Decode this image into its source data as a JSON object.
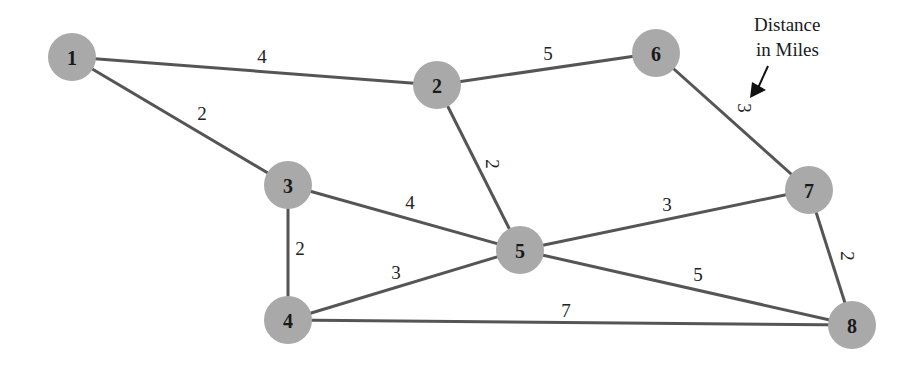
{
  "diagram": {
    "type": "weighted-undirected-graph",
    "annotation": {
      "line1": "Distance",
      "line2": "in Miles"
    },
    "nodes": [
      {
        "id": "1",
        "label": "1",
        "x": 72,
        "y": 57
      },
      {
        "id": "2",
        "label": "2",
        "x": 437,
        "y": 85
      },
      {
        "id": "3",
        "label": "3",
        "x": 288,
        "y": 185
      },
      {
        "id": "4",
        "label": "4",
        "x": 288,
        "y": 320
      },
      {
        "id": "5",
        "label": "5",
        "x": 520,
        "y": 250
      },
      {
        "id": "6",
        "label": "6",
        "x": 656,
        "y": 53
      },
      {
        "id": "7",
        "label": "7",
        "x": 809,
        "y": 190
      },
      {
        "id": "8",
        "label": "8",
        "x": 852,
        "y": 325
      }
    ],
    "edges": [
      {
        "from": "1",
        "to": "2",
        "weight": "4",
        "lx": 262,
        "ly": 56,
        "rot": 0
      },
      {
        "from": "1",
        "to": "3",
        "weight": "2",
        "lx": 202,
        "ly": 113,
        "rot": 0
      },
      {
        "from": "2",
        "to": "6",
        "weight": "5",
        "lx": 548,
        "ly": 53,
        "rot": 0
      },
      {
        "from": "2",
        "to": "5",
        "weight": "2",
        "lx": 492,
        "ly": 164,
        "rot": 90
      },
      {
        "from": "6",
        "to": "7",
        "weight": "3",
        "lx": 744,
        "ly": 108,
        "rot": 90
      },
      {
        "from": "3",
        "to": "5",
        "weight": "4",
        "lx": 410,
        "ly": 202,
        "rot": 0
      },
      {
        "from": "3",
        "to": "4",
        "weight": "2",
        "lx": 300,
        "ly": 248,
        "rot": 0
      },
      {
        "from": "5",
        "to": "7",
        "weight": "3",
        "lx": 667,
        "ly": 204,
        "rot": 0
      },
      {
        "from": "4",
        "to": "5",
        "weight": "3",
        "lx": 396,
        "ly": 272,
        "rot": 0
      },
      {
        "from": "5",
        "to": "8",
        "weight": "5",
        "lx": 698,
        "ly": 274,
        "rot": 0
      },
      {
        "from": "7",
        "to": "8",
        "weight": "2",
        "lx": 847,
        "ly": 256,
        "rot": 90
      },
      {
        "from": "4",
        "to": "8",
        "weight": "7",
        "lx": 566,
        "ly": 310,
        "rot": 0
      }
    ]
  }
}
